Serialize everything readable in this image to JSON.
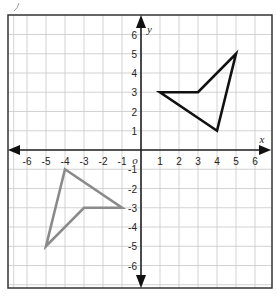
{
  "diagram": {
    "type": "coordinate-plane",
    "x_range": [
      -6,
      6
    ],
    "y_range": [
      -6,
      6
    ],
    "x_axis_label": "x",
    "y_axis_label": "y",
    "origin_label": "o",
    "x_tick_labels": [
      "-6",
      "-5",
      "-4",
      "-3",
      "-2",
      "-1",
      "1",
      "2",
      "3",
      "4",
      "5",
      "6"
    ],
    "y_tick_labels": [
      "6",
      "5",
      "4",
      "3",
      "2",
      "1",
      "-1",
      "-2",
      "-3",
      "-4",
      "-5",
      "-6"
    ],
    "grid": true,
    "shapes": [
      {
        "name": "dark-quadrilateral",
        "quadrant": "I",
        "color": "#111111",
        "vertices": [
          [
            1,
            3
          ],
          [
            3,
            3
          ],
          [
            5,
            5
          ],
          [
            4,
            1
          ]
        ]
      },
      {
        "name": "gray-quadrilateral",
        "quadrant": "III",
        "color": "#8a8a8a",
        "vertices": [
          [
            -1,
            -3
          ],
          [
            -3,
            -3
          ],
          [
            -5,
            -5
          ],
          [
            -4,
            -1
          ]
        ]
      }
    ],
    "colors": {
      "grid": "#c8c8c8",
      "border": "#333333",
      "axis": "#222222"
    }
  }
}
